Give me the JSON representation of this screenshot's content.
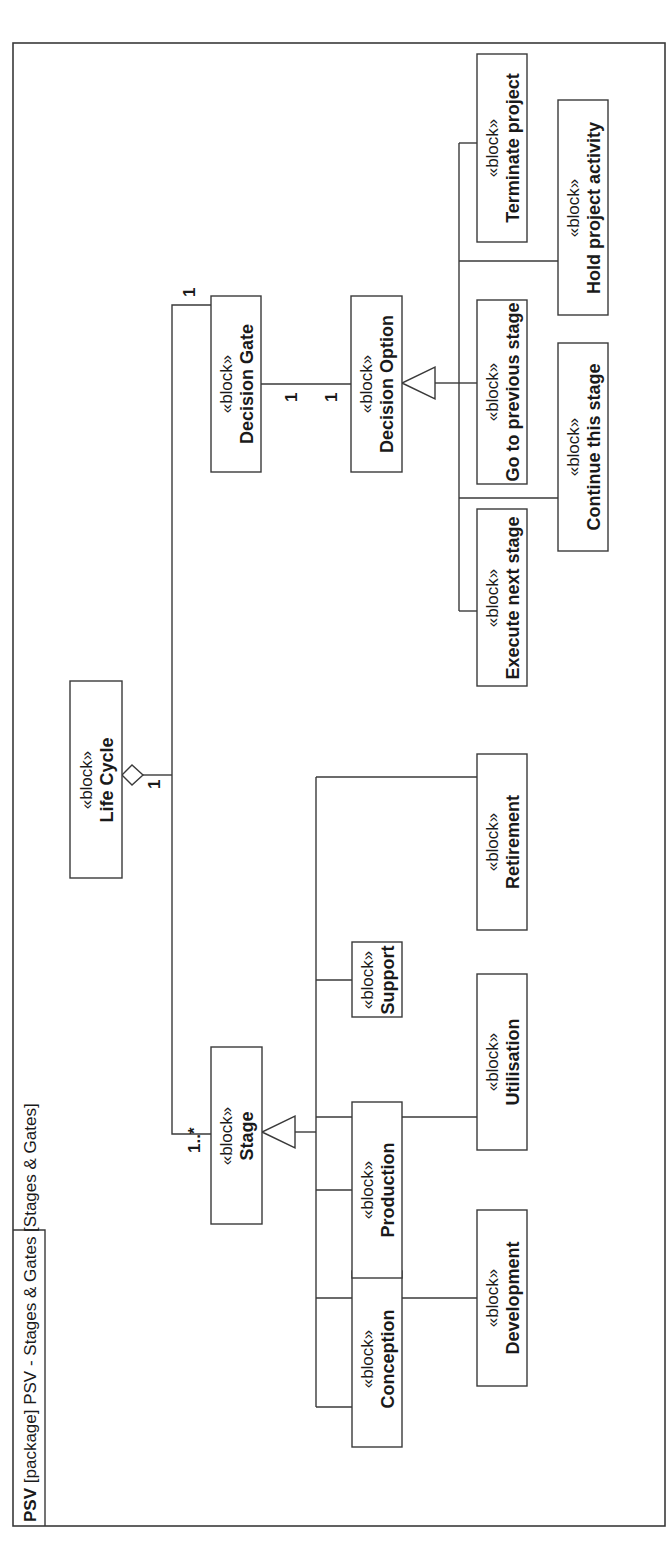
{
  "diagram": {
    "frame_title_kind": "PSV",
    "frame_title_rest": " [package] PSV - Stages & Gates [Stages & Gates]",
    "stereotype": "«block»",
    "blocks": {
      "life_cycle": "Life Cycle",
      "stage": "Stage",
      "decision_gate": "Decision Gate",
      "decision_option": "Decision Option",
      "conception": "Conception",
      "development": "Development",
      "production": "Production",
      "utilisation": "Utilisation",
      "support": "Support",
      "retirement": "Retirement",
      "execute_next_stage": "Execute next stage",
      "continue_this_stage": "Continue this stage",
      "go_to_previous_stage": "Go to previous stage",
      "hold_project_activity": "Hold project activity",
      "terminate_project": "Terminate project"
    },
    "multiplicities": {
      "lifecycle_end": "1",
      "stage_end": "1..*",
      "gate_end_from_lifecycle": "1",
      "gate_to_option_gate_end": "1",
      "gate_to_option_option_end": "1"
    },
    "relationships": [
      {
        "type": "aggregation",
        "from": "Life Cycle",
        "to": "Stage",
        "multiplicity": "1..*"
      },
      {
        "type": "aggregation",
        "from": "Life Cycle",
        "to": "Decision Gate",
        "multiplicity": "1"
      },
      {
        "type": "association",
        "from": "Decision Gate",
        "to": "Decision Option",
        "multiplicity": "1 - 1"
      },
      {
        "type": "generalization",
        "parent": "Stage",
        "children": [
          "Conception",
          "Development",
          "Production",
          "Utilisation",
          "Support",
          "Retirement"
        ]
      },
      {
        "type": "generalization",
        "parent": "Decision Option",
        "children": [
          "Execute next stage",
          "Continue this stage",
          "Go to previous stage",
          "Hold project activity",
          "Terminate project"
        ]
      }
    ],
    "colors": {
      "line": "#3a3a3a",
      "background": "#ffffff",
      "text": "#1a1a1a"
    }
  }
}
